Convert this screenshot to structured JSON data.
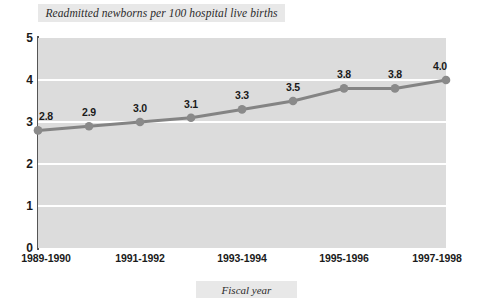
{
  "chart_data": {
    "type": "line",
    "title": "Readmitted newborns per 100 hospital live births",
    "xlabel": "Fiscal year",
    "ylabel": "",
    "categories": [
      "1989-1990",
      "1990-1991",
      "1991-1992",
      "1992-1993",
      "1993-1994",
      "1994-1995",
      "1995-1996",
      "1996-1997",
      "1997-1998"
    ],
    "values": [
      2.8,
      2.9,
      3.0,
      3.1,
      3.3,
      3.5,
      3.8,
      3.8,
      4.0
    ],
    "point_labels": [
      "2.8",
      "2.9",
      "3.0",
      "3.1",
      "3.3",
      "3.5",
      "3.8",
      "3.8",
      "4.0"
    ],
    "x_tick_labels": [
      "1989-1990",
      "1991-1992",
      "1993-1994",
      "1995-1996",
      "1997-1998"
    ],
    "x_tick_indices": [
      0,
      2,
      4,
      6,
      8
    ],
    "y_tick_labels": [
      "0",
      "1",
      "2",
      "3",
      "4",
      "5"
    ],
    "y_ticks": [
      0,
      1,
      2,
      3,
      4,
      5
    ],
    "ylim": [
      0,
      5
    ],
    "grid": true,
    "gridline_values": [
      1,
      2,
      3,
      4
    ],
    "legend": null,
    "series_name": "Readmitted newborns per 100 hospital live births",
    "colors": {
      "line": "#848484",
      "marker": "#8a8a8a",
      "plot_background": "#dcdcdc",
      "gridline": "#ffffff",
      "axis": "#555555",
      "label_box": "#e8e8e8",
      "text": "#1a1a1a",
      "page_background": "#ffffff"
    }
  }
}
